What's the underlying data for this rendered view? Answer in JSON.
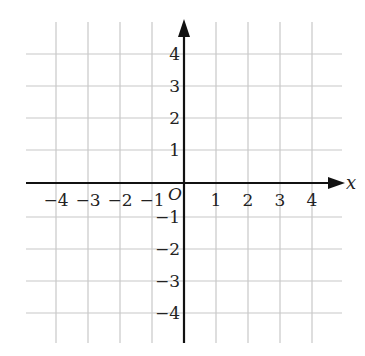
{
  "diagram": {
    "type": "coordinate-plane",
    "x_axis_label": "x",
    "origin_label": "O",
    "x_range": [
      -4,
      4
    ],
    "y_range": [
      -4,
      4
    ],
    "x_ticks": [
      {
        "value": -4,
        "label": "−4"
      },
      {
        "value": -3,
        "label": "−3"
      },
      {
        "value": -2,
        "label": "−2"
      },
      {
        "value": -1,
        "label": "−1"
      },
      {
        "value": 1,
        "label": "1"
      },
      {
        "value": 2,
        "label": "2"
      },
      {
        "value": 3,
        "label": "3"
      },
      {
        "value": 4,
        "label": "4"
      }
    ],
    "y_ticks": [
      {
        "value": 4,
        "label": "4"
      },
      {
        "value": 3,
        "label": "3"
      },
      {
        "value": 2,
        "label": "2"
      },
      {
        "value": 1,
        "label": "1"
      },
      {
        "value": -1,
        "label": "−1"
      },
      {
        "value": -2,
        "label": "−2"
      },
      {
        "value": -3,
        "label": "−3"
      },
      {
        "value": -4,
        "label": "−4"
      }
    ],
    "grid_color": "#c8c8c8",
    "axis_color": "#111111"
  }
}
